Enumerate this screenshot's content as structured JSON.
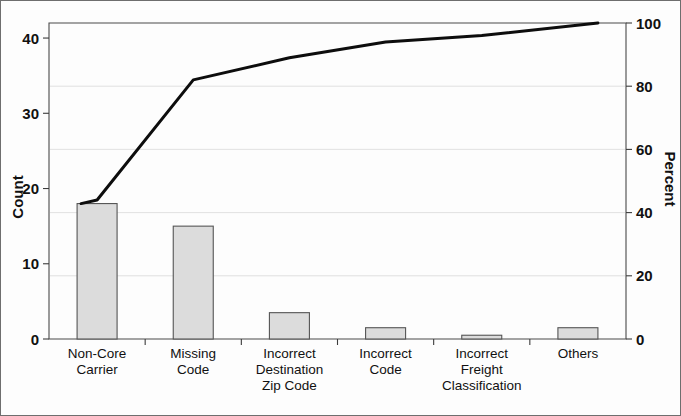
{
  "chart_data": {
    "type": "bar",
    "title": "",
    "subtitle": "",
    "xlabel": "",
    "ylabel": "Count",
    "y2label": "Percent",
    "categories": [
      "Non-Core Carrier",
      "Missing Code",
      "Incorrect Destination Zip Code",
      "Incorrect Code",
      "Incorrect Freight Classification",
      "Others"
    ],
    "category_lines": [
      [
        "Non-Core",
        "Carrier"
      ],
      [
        "Missing",
        "Code"
      ],
      [
        "Incorrect",
        "Destination",
        "Zip Code"
      ],
      [
        "Incorrect",
        "Code"
      ],
      [
        "Incorrect",
        "Freight",
        "Classification"
      ],
      [
        "Others"
      ]
    ],
    "values": [
      18,
      15,
      3.5,
      1.5,
      0.5,
      1.5
    ],
    "cumulative_percent": [
      44,
      82,
      89,
      94,
      96,
      100
    ],
    "total": 40,
    "ylim": [
      0,
      42
    ],
    "y2lim": [
      0,
      100
    ],
    "yticks": [
      0,
      10,
      20,
      30,
      40
    ],
    "ytick_labels": [
      "0",
      "10",
      "20",
      "30",
      "40"
    ],
    "y2ticks": [
      0,
      20,
      40,
      60,
      80,
      100
    ],
    "y2tick_labels": [
      "0",
      "20",
      "40",
      "60",
      "80",
      "100"
    ],
    "grid": true,
    "grid_axis": "y",
    "legend": "none",
    "series": [
      {
        "name": "Count",
        "type": "bar",
        "values": [
          18,
          15,
          3.5,
          1.5,
          0.5,
          1.5
        ]
      },
      {
        "name": "Cumulative Percent",
        "type": "line",
        "values": [
          44,
          82,
          89,
          94,
          96,
          100
        ]
      }
    ],
    "colors": {
      "bar_fill": "#dcdcdc",
      "bar_edge": "#555555",
      "line": "#0d0d0d",
      "grid": "#dedede",
      "frame": "#4a4a4a",
      "text": "#111111",
      "background": "#fdfdfd"
    }
  }
}
